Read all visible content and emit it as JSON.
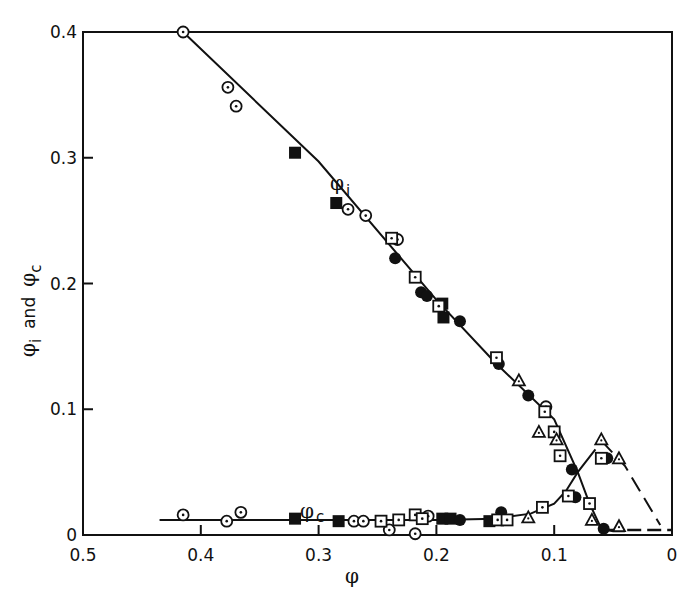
{
  "chart_data": {
    "type": "scatter",
    "title": "",
    "xlabel": "φ",
    "ylabel": "φi and φc",
    "xlim": [
      0.5,
      0
    ],
    "ylim": [
      0,
      0.4
    ],
    "x_reversed": true,
    "grid": false,
    "legend": "none (series labeled inline)",
    "x_ticks": [
      "0.5",
      "0.4",
      "0.3",
      "0.2",
      "0.1",
      "0"
    ],
    "y_ticks": [
      "0",
      "0.1",
      "0.2",
      "0.3",
      "0.4"
    ],
    "annotations": [
      {
        "text": "φi",
        "x": 0.29,
        "y": 0.297
      },
      {
        "text": "φc",
        "x": 0.29,
        "y": 0.018
      }
    ],
    "curves": [
      {
        "name": "φi fit",
        "style": "solid",
        "points": [
          [
            0.415,
            0.4
          ],
          [
            0.3,
            0.297
          ],
          [
            0.2,
            0.187
          ],
          [
            0.15,
            0.137
          ],
          [
            0.1,
            0.092
          ],
          [
            0.08,
            0.05
          ],
          [
            0.07,
            0.025
          ],
          [
            0.06,
            0.005
          ],
          [
            0.05,
            0.003
          ],
          [
            0.04,
            0.003
          ]
        ]
      },
      {
        "name": "φc fit",
        "style": "solid",
        "points": [
          [
            0.435,
            0.012
          ],
          [
            0.3,
            0.012
          ],
          [
            0.2,
            0.012
          ],
          [
            0.15,
            0.013
          ],
          [
            0.12,
            0.017
          ],
          [
            0.1,
            0.025
          ],
          [
            0.09,
            0.035
          ],
          [
            0.08,
            0.05
          ],
          [
            0.065,
            0.068
          ]
        ]
      },
      {
        "name": "φc extrapolated",
        "style": "dashed",
        "points": [
          [
            0.06,
            0.075
          ],
          [
            0.04,
            0.055
          ],
          [
            0.01,
            0.008
          ],
          [
            0.0,
            0.007
          ],
          [
            0.06,
            0.004
          ]
        ]
      }
    ],
    "series": [
      {
        "name": "open circle (dotted)",
        "marker": "circle-dot",
        "phi_i": [
          [
            0.415,
            0.4
          ],
          [
            0.377,
            0.356
          ],
          [
            0.37,
            0.341
          ],
          [
            0.275,
            0.259
          ],
          [
            0.26,
            0.254
          ],
          [
            0.233,
            0.235
          ],
          [
            0.107,
            0.102
          ]
        ],
        "phi_c": [
          [
            0.415,
            0.016
          ],
          [
            0.378,
            0.011
          ],
          [
            0.366,
            0.018
          ],
          [
            0.27,
            0.011
          ],
          [
            0.262,
            0.011
          ],
          [
            0.24,
            0.004
          ],
          [
            0.218,
            0.001
          ],
          [
            0.207,
            0.015
          ]
        ]
      },
      {
        "name": "filled square",
        "marker": "square-filled",
        "phi_i": [
          [
            0.32,
            0.304
          ],
          [
            0.285,
            0.264
          ],
          [
            0.195,
            0.184
          ],
          [
            0.194,
            0.173
          ]
        ],
        "phi_c": [
          [
            0.32,
            0.013
          ],
          [
            0.283,
            0.011
          ],
          [
            0.195,
            0.013
          ],
          [
            0.188,
            0.013
          ],
          [
            0.155,
            0.011
          ]
        ]
      },
      {
        "name": "filled circle",
        "marker": "circle-filled",
        "phi_i": [
          [
            0.235,
            0.22
          ],
          [
            0.213,
            0.193
          ],
          [
            0.208,
            0.19
          ],
          [
            0.18,
            0.17
          ],
          [
            0.147,
            0.136
          ],
          [
            0.122,
            0.111
          ],
          [
            0.085,
            0.052
          ],
          [
            0.058,
            0.005
          ]
        ],
        "phi_c": [
          [
            0.18,
            0.012
          ],
          [
            0.145,
            0.018
          ],
          [
            0.148,
            0.012
          ],
          [
            0.082,
            0.03
          ],
          [
            0.055,
            0.061
          ]
        ]
      },
      {
        "name": "open square (dotted)",
        "marker": "square-dot",
        "phi_i": [
          [
            0.238,
            0.236
          ],
          [
            0.218,
            0.205
          ],
          [
            0.198,
            0.182
          ],
          [
            0.149,
            0.141
          ],
          [
            0.108,
            0.098
          ],
          [
            0.1,
            0.082
          ],
          [
            0.095,
            0.063
          ],
          [
            0.07,
            0.025
          ]
        ],
        "phi_c": [
          [
            0.247,
            0.011
          ],
          [
            0.232,
            0.012
          ],
          [
            0.218,
            0.016
          ],
          [
            0.212,
            0.013
          ],
          [
            0.148,
            0.012
          ],
          [
            0.14,
            0.012
          ],
          [
            0.11,
            0.022
          ],
          [
            0.088,
            0.031
          ],
          [
            0.06,
            0.061
          ]
        ]
      },
      {
        "name": "open triangle (dotted)",
        "marker": "triangle-dot",
        "phi_i": [
          [
            0.13,
            0.123
          ],
          [
            0.113,
            0.082
          ],
          [
            0.098,
            0.076
          ],
          [
            0.068,
            0.012
          ]
        ],
        "phi_c": [
          [
            0.122,
            0.014
          ],
          [
            0.06,
            0.076
          ],
          [
            0.045,
            0.061
          ],
          [
            0.045,
            0.007
          ]
        ]
      }
    ]
  },
  "labels": {
    "x_axis_title": "φ",
    "y_axis_title_main_1": "φ",
    "y_axis_title_sub_1": "i",
    "y_axis_title_and": "and",
    "y_axis_title_main_2": "φ",
    "y_axis_title_sub_2": "c",
    "series_label_i_main": "φ",
    "series_label_i_sub": "i",
    "series_label_c_main": "φ",
    "series_label_c_sub": "c"
  }
}
